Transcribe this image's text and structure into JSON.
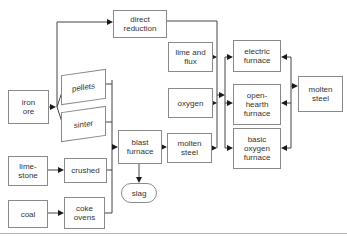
{
  "diagram": {
    "type": "flowchart",
    "colors": {
      "background": "#ffffff",
      "box_border": "#8a8a8a",
      "line": "#444444",
      "arrowhead": "#1a1a1a",
      "text": "#333333"
    }
  },
  "nodes": {
    "direct_reduction": {
      "line1": "direct",
      "line2": "reduction"
    },
    "iron_ore": {
      "line1": "iron",
      "line2": "ore"
    },
    "pellets": {
      "line1": "pellets"
    },
    "sinter": {
      "line1": "sinter"
    },
    "limestone": {
      "line1": "lime-",
      "line2": "stone"
    },
    "crushed": {
      "line1": "crushed"
    },
    "coal": {
      "line1": "coal"
    },
    "coke_ovens": {
      "line1": "coke",
      "line2": "ovens"
    },
    "blast_furnace": {
      "line1": "blast",
      "line2": "furnace"
    },
    "molten_steel_mid": {
      "line1": "molten",
      "line2": "steel"
    },
    "slag": {
      "line1": "slag"
    },
    "lime_flux": {
      "line1": "lime and",
      "line2": "flux"
    },
    "oxygen": {
      "line1": "oxygen"
    },
    "electric_furnace": {
      "line1": "electric",
      "line2": "furnace"
    },
    "open_hearth_furnace": {
      "line1": "open-",
      "line2": "hearth",
      "line3": "furnace"
    },
    "basic_oxygen_furnace": {
      "line1": "basic",
      "line2": "oxygen",
      "line3": "furnace"
    },
    "molten_steel_final": {
      "line1": "molten",
      "line2": "steel"
    }
  },
  "edges": [
    {
      "from": "iron ore",
      "to": "direct reduction"
    },
    {
      "from": "iron ore",
      "to": "pellets"
    },
    {
      "from": "iron ore",
      "to": "sinter"
    },
    {
      "from": "pellets",
      "to": "blast furnace"
    },
    {
      "from": "sinter",
      "to": "blast furnace"
    },
    {
      "from": "lime-stone",
      "to": "crushed"
    },
    {
      "from": "crushed",
      "to": "blast furnace"
    },
    {
      "from": "coal",
      "to": "coke ovens"
    },
    {
      "from": "coke ovens",
      "to": "blast furnace"
    },
    {
      "from": "blast furnace",
      "to": "molten steel"
    },
    {
      "from": "blast furnace",
      "to": "slag"
    },
    {
      "from": "direct reduction",
      "to": "furnace feed line"
    },
    {
      "from": "lime and flux",
      "to": "furnace feed line"
    },
    {
      "from": "oxygen",
      "to": "furnace feed line"
    },
    {
      "from": "molten steel",
      "to": "furnace feed line"
    },
    {
      "from": "furnace feed line",
      "to": "electric furnace"
    },
    {
      "from": "furnace feed line",
      "to": "open-hearth furnace"
    },
    {
      "from": "furnace feed line",
      "to": "basic oxygen furnace"
    },
    {
      "from": "right feed line",
      "to": "electric furnace"
    },
    {
      "from": "right feed line",
      "to": "open-hearth furnace"
    },
    {
      "from": "right feed line",
      "to": "basic oxygen furnace"
    },
    {
      "from": "right feed line",
      "to": "molten steel"
    }
  ]
}
